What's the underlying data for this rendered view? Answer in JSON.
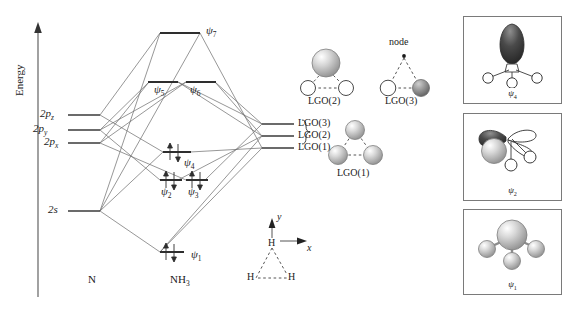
{
  "figure": {
    "type": "molecular-orbital-diagram",
    "molecule": "NH3",
    "axis_label": "Energy",
    "left_fragment_label": "N",
    "right_fragment_label": "NH",
    "right_fragment_sub": "3"
  },
  "atomic_orbitals": [
    {
      "id": "2pz",
      "base": "2p",
      "sub": "z",
      "energy_y": 115
    },
    {
      "id": "2py",
      "base": "2p",
      "sub": "y",
      "energy_y": 130
    },
    {
      "id": "2px",
      "base": "2p",
      "sub": "x",
      "energy_y": 143
    },
    {
      "id": "2s",
      "base": "2s",
      "sub": "",
      "energy_y": 211
    }
  ],
  "molecular_orbitals": [
    {
      "id": "psi7",
      "symbol": "ψ",
      "sub": "7",
      "energy_y": 33,
      "electrons": 0
    },
    {
      "id": "psi5",
      "symbol": "ψ",
      "sub": "5",
      "energy_y": 82,
      "electrons": 0
    },
    {
      "id": "psi6",
      "symbol": "ψ",
      "sub": "6",
      "energy_y": 82,
      "electrons": 0
    },
    {
      "id": "psi4",
      "symbol": "ψ",
      "sub": "4",
      "energy_y": 152,
      "electrons": 2
    },
    {
      "id": "psi2",
      "symbol": "ψ",
      "sub": "2",
      "energy_y": 180,
      "electrons": 2
    },
    {
      "id": "psi3",
      "symbol": "ψ",
      "sub": "3",
      "energy_y": 180,
      "electrons": 2
    },
    {
      "id": "psi1",
      "symbol": "ψ",
      "sub": "1",
      "energy_y": 252,
      "electrons": 2
    }
  ],
  "ligand_group_orbitals": [
    {
      "id": "lgo3",
      "label": "LGO(3)",
      "energy_y": 124
    },
    {
      "id": "lgo2",
      "label": "LGO(2)",
      "energy_y": 136
    },
    {
      "id": "lgo1",
      "label": "LGO(1)",
      "energy_y": 148
    }
  ],
  "lgo_pictures": [
    {
      "id": "lgo2-pic",
      "caption": "LGO(2)",
      "annotation": ""
    },
    {
      "id": "lgo3-pic",
      "caption": "LGO(3)",
      "annotation": "node"
    },
    {
      "id": "lgo1-pic",
      "caption": "LGO(1)",
      "annotation": ""
    }
  ],
  "mo_pictures": [
    {
      "id": "psi4-pic",
      "caption_symbol": "ψ",
      "caption_sub": "4"
    },
    {
      "id": "psi2-pic",
      "caption_symbol": "ψ",
      "caption_sub": "2"
    },
    {
      "id": "psi1-pic",
      "caption_symbol": "ψ",
      "caption_sub": "1"
    }
  ],
  "geometry_inset": {
    "axis_x_label": "x",
    "axis_y_label": "y",
    "atom_top": "H",
    "atom_left": "H",
    "atom_right": "H"
  },
  "colors": {
    "line": "#555555",
    "level": "#444444",
    "text": "#1a1a1a",
    "panel_border": "#7a7a7a",
    "sphere_light": "#f2f2f2",
    "sphere_mid": "#bdbdbd",
    "sphere_dark": "#8a8a8a",
    "lobe_dark": "#3a3a3a"
  }
}
